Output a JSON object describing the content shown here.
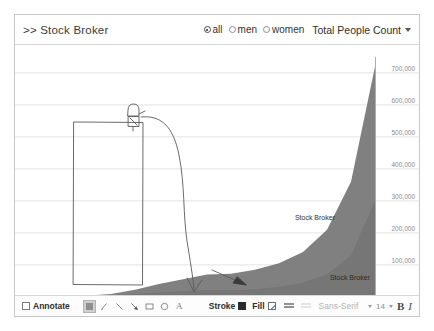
{
  "header": {
    "title": ">> Stock Broker",
    "radio_options": [
      {
        "label": "all",
        "selected": true
      },
      {
        "label": "men",
        "selected": false
      },
      {
        "label": "women",
        "selected": false
      }
    ],
    "metric_label": "Total People Count",
    "caret_icon": "chevron-down-icon"
  },
  "toolbar": {
    "annotate_label": "Annotate",
    "stroke_label": "Stroke",
    "fill_label": "Fill",
    "font_name": "Sans-Serif",
    "font_size": "14",
    "bold_label": "B",
    "italic_label": "I",
    "tools": [
      {
        "name": "select-tool",
        "glyph": "▣",
        "active": true
      },
      {
        "name": "pencil-tool",
        "glyph": "✐",
        "active": false
      },
      {
        "name": "line-tool",
        "glyph": "╲",
        "active": false
      },
      {
        "name": "arrow-tool",
        "glyph": "↘",
        "active": false
      },
      {
        "name": "rectangle-tool",
        "glyph": "▭",
        "active": false
      },
      {
        "name": "ellipse-tool",
        "glyph": "○",
        "active": false
      },
      {
        "name": "text-tool",
        "glyph": "A",
        "active": false
      }
    ]
  },
  "chart_data": {
    "type": "area",
    "title": "Stock Broker",
    "xlabel": "",
    "ylabel": "",
    "xlim": [
      1850,
      2000
    ],
    "ylim": [
      0,
      750000
    ],
    "xticks": [
      1850,
      1870,
      1900,
      1920,
      1940,
      1960,
      1980,
      2000
    ],
    "yticks": [
      100000,
      200000,
      300000,
      400000,
      500000,
      600000,
      700000
    ],
    "ytick_labels": [
      "100,000",
      "200,000",
      "300,000",
      "400,000",
      "500,000",
      "600,000",
      "700,000"
    ],
    "grid": true,
    "legend": "none",
    "fill_color": "#808080",
    "series": [
      {
        "name": "Stock Broker",
        "label": "Stock Broker",
        "label_position": "lower",
        "x": [
          1850,
          1860,
          1870,
          1880,
          1890,
          1900,
          1910,
          1920,
          1930,
          1940,
          1950,
          1960,
          1970,
          1980,
          1990,
          2000
        ],
        "values": [
          1000,
          1500,
          2000,
          3000,
          5000,
          9000,
          14000,
          18000,
          22000,
          20000,
          24000,
          32000,
          45000,
          70000,
          130000,
          300000
        ]
      },
      {
        "name": "Stock Broker",
        "label": "Stock Broker",
        "label_position": "upper",
        "x": [
          1850,
          1860,
          1870,
          1880,
          1890,
          1900,
          1910,
          1920,
          1930,
          1940,
          1950,
          1960,
          1970,
          1980,
          1990,
          2000
        ],
        "values": [
          1000,
          1500,
          2500,
          4000,
          9000,
          22000,
          40000,
          55000,
          70000,
          72000,
          85000,
          105000,
          140000,
          210000,
          360000,
          720000
        ]
      }
    ],
    "annotations": [
      {
        "name": "annotation-rectangle",
        "type": "rectangle"
      },
      {
        "name": "annotation-stick-figure",
        "type": "figure"
      },
      {
        "name": "annotation-curved-arrow",
        "type": "arrow"
      },
      {
        "name": "annotation-straight-arrow",
        "type": "arrow"
      }
    ]
  }
}
